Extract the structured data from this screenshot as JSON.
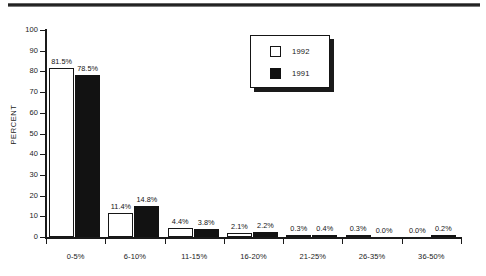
{
  "page": {
    "background_color": "#ffffff",
    "ink_color": "#111111",
    "top_rule": "horizontal-rule"
  },
  "legend": {
    "position": "top-center-right",
    "entries": [
      {
        "label": "1992",
        "swatch": "open-square-white",
        "color": "#ffffff"
      },
      {
        "label": "1991",
        "swatch": "filled-square-black",
        "color": "#111111"
      }
    ]
  },
  "axes": {
    "y_title": "PERCENT",
    "y_ticks": [
      "0",
      "10",
      "20",
      "30",
      "40",
      "50",
      "60",
      "70",
      "80",
      "90",
      "100"
    ],
    "x_categories": [
      "0-5%",
      "6-10%",
      "11-15%",
      "16-20%",
      "21-25%",
      "26-35%",
      "36-50%"
    ]
  },
  "bar_labels": {
    "g0": {
      "a": "81.5%",
      "b": "78.5%"
    },
    "g1": {
      "a": "11.4%",
      "b": "14.8%"
    },
    "g2": {
      "a": "4.4%",
      "b": "3.8%"
    },
    "g3": {
      "a": "2.1%",
      "b": "2.2%"
    },
    "g4": {
      "a": "0.3%",
      "b": "0.4%"
    },
    "g5": {
      "a": "0.3%",
      "b": "0.0%"
    },
    "g6": {
      "a": "0.0%",
      "b": "0.2%"
    }
  },
  "chart_data": {
    "type": "bar",
    "title": "",
    "xlabel": "",
    "ylabel": "PERCENT",
    "ylim": [
      0,
      100
    ],
    "ytick_step": 10,
    "grid": false,
    "legend_position": "upper center right",
    "categories": [
      "0-5%",
      "6-10%",
      "11-15%",
      "16-20%",
      "21-25%",
      "26-35%",
      "36-50%"
    ],
    "series": [
      {
        "name": "1992",
        "color": "#ffffff",
        "edge_color": "#161616",
        "values": [
          81.5,
          11.4,
          4.4,
          2.1,
          0.3,
          0.3,
          0.0
        ],
        "value_labels": [
          "81.5%",
          "11.4%",
          "4.4%",
          "2.1%",
          "0.3%",
          "0.3%",
          "0.0%"
        ]
      },
      {
        "name": "1991",
        "color": "#111111",
        "edge_color": "#111111",
        "values": [
          78.5,
          14.8,
          3.8,
          2.2,
          0.4,
          0.0,
          0.2
        ],
        "value_labels": [
          "78.5%",
          "14.8%",
          "3.8%",
          "2.2%",
          "0.4%",
          "0.0%",
          "0.2%"
        ]
      }
    ]
  }
}
